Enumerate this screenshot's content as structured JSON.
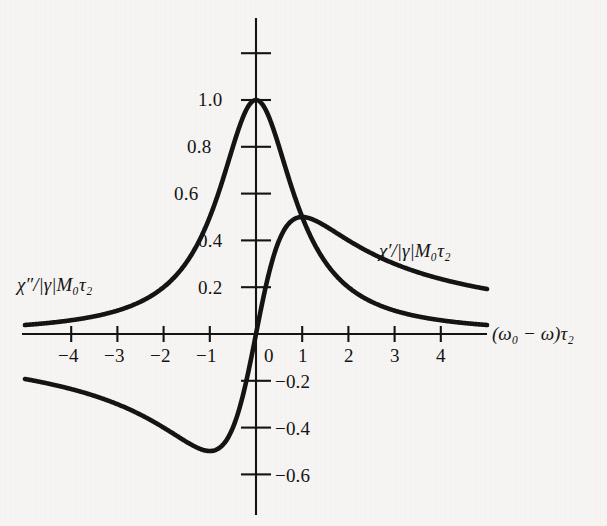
{
  "figure": {
    "background_color": "#f6f5f3",
    "ink_color": "#141414"
  },
  "chart_data": {
    "type": "line",
    "title": "",
    "subtitle": "",
    "xlabel": "(ω₀ − ω)τ₂",
    "ylabel": "",
    "xlim": [
      -5.0,
      5.0
    ],
    "ylim": [
      -0.75,
      1.25
    ],
    "grid": false,
    "legend_position": "inline-annotations",
    "x_ticks": [
      -4,
      -3,
      -2,
      -1,
      0,
      1,
      2,
      3,
      4
    ],
    "x_tick_labels": [
      "−4",
      "−3",
      "−2",
      "−1",
      "0",
      "1",
      "2",
      "3",
      "4"
    ],
    "y_ticks": [
      1.2,
      1.0,
      0.8,
      0.6,
      0.4,
      0.2,
      -0.2,
      -0.4,
      -0.6
    ],
    "y_tick_labels": [
      "",
      "1.0",
      "0.8",
      "0.6",
      "0.4",
      "0.2",
      "−0.2",
      "−0.4",
      "−0.6"
    ],
    "annotations": [
      {
        "id": "chi-double-prime-label",
        "text": "χ″/|γ|M₀τ₂",
        "x": -5.0,
        "y": 0.23
      },
      {
        "id": "chi-prime-label",
        "text": "χ′/|γ|M₀τ₂",
        "x": 2.8,
        "y": 0.4
      }
    ],
    "series": [
      {
        "name": "χ″/|γ|M₀τ₂",
        "description": "absorption, Lorentzian 1/(1+x^2)",
        "formula": "y = 1/(1+x^2)",
        "color": "#141414",
        "x": [
          -5.0,
          -4.5,
          -4.0,
          -3.5,
          -3.0,
          -2.5,
          -2.0,
          -1.75,
          -1.5,
          -1.25,
          -1.0,
          -0.8,
          -0.6,
          -0.4,
          -0.2,
          0.0,
          0.2,
          0.4,
          0.6,
          0.8,
          1.0,
          1.25,
          1.5,
          1.75,
          2.0,
          2.5,
          3.0,
          3.5,
          4.0,
          4.5,
          5.0
        ],
        "values": [
          0.038,
          0.047,
          0.059,
          0.075,
          0.1,
          0.138,
          0.2,
          0.246,
          0.308,
          0.39,
          0.5,
          0.61,
          0.735,
          0.862,
          0.962,
          1.0,
          0.962,
          0.862,
          0.735,
          0.61,
          0.5,
          0.39,
          0.308,
          0.246,
          0.2,
          0.138,
          0.1,
          0.075,
          0.059,
          0.047,
          0.038
        ]
      },
      {
        "name": "χ′/|γ|M₀τ₂",
        "description": "dispersion, x/(1+x^2)",
        "formula": "y = x/(1+x^2)",
        "color": "#141414",
        "x": [
          -5.0,
          -4.5,
          -4.0,
          -3.5,
          -3.0,
          -2.5,
          -2.0,
          -1.75,
          -1.5,
          -1.25,
          -1.0,
          -0.8,
          -0.6,
          -0.4,
          -0.2,
          0.0,
          0.2,
          0.4,
          0.6,
          0.8,
          1.0,
          1.25,
          1.5,
          1.75,
          2.0,
          2.5,
          3.0,
          3.5,
          4.0,
          4.5,
          5.0
        ],
        "values": [
          -0.192,
          -0.213,
          -0.235,
          -0.264,
          -0.3,
          -0.345,
          -0.4,
          -0.431,
          -0.462,
          -0.488,
          -0.5,
          -0.488,
          -0.441,
          -0.345,
          -0.192,
          0.0,
          0.192,
          0.345,
          0.441,
          0.488,
          0.5,
          0.488,
          0.462,
          0.431,
          0.4,
          0.345,
          0.3,
          0.264,
          0.235,
          0.213,
          0.192
        ]
      }
    ]
  }
}
